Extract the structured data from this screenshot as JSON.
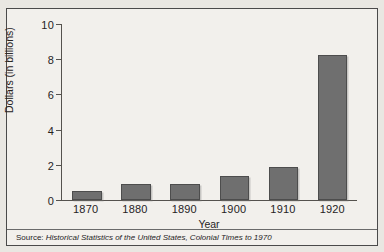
{
  "chart_data": {
    "type": "bar",
    "title": "",
    "xlabel": "Year",
    "ylabel": "Dollars (in billions)",
    "categories": [
      "1870",
      "1880",
      "1890",
      "1900",
      "1910",
      "1920"
    ],
    "values": [
      0.5,
      0.9,
      0.9,
      1.35,
      1.85,
      8.3
    ],
    "ylim": [
      0,
      10
    ],
    "yticks": [
      0,
      2,
      4,
      6,
      8,
      10
    ],
    "ytick_labels": [
      "0",
      "2",
      "4",
      "6",
      "8",
      "10"
    ],
    "grid": false,
    "legend": null,
    "bar_color": "#6f6f6f",
    "bar_border_color": "#4d4d4d",
    "axis_color": "#55524e",
    "background_color": "#f2f0ec"
  },
  "footer": {
    "source_label": "Source: ",
    "source_title": "Historical Statistics of the United States, Colonial Times to 1970"
  }
}
